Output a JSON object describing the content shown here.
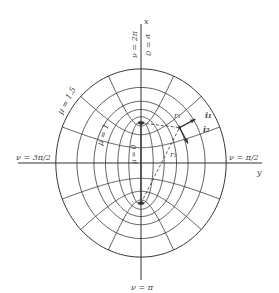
{
  "diagram": {
    "center": [
      141,
      163
    ],
    "focal_half_distance": 40,
    "mu_values": [
      0.3,
      0.55,
      0.8,
      1.0,
      1.25,
      1.5
    ],
    "nu_step_deg": 22.5,
    "colors": {
      "line": "#333333",
      "text": "#444444",
      "background": "#ffffff"
    },
    "axes": {
      "x_axis_label": "x",
      "y_axis_label": "y"
    },
    "labels": {
      "nu_top": "ν = 2π",
      "nu_top_right": "ν = 0",
      "nu_right": "ν = π/2",
      "nu_left": "ν = 3π/2",
      "nu_bottom": "ν = π",
      "mu_15": "μ = 1.5",
      "mu_1": "μ = 1",
      "mu_0": "μ = 0",
      "r1": "r₁",
      "r2": "r₂",
      "i1": "i₁",
      "i2": "i₂"
    },
    "point": {
      "mu": 1.0,
      "nu_deg": 55
    }
  }
}
